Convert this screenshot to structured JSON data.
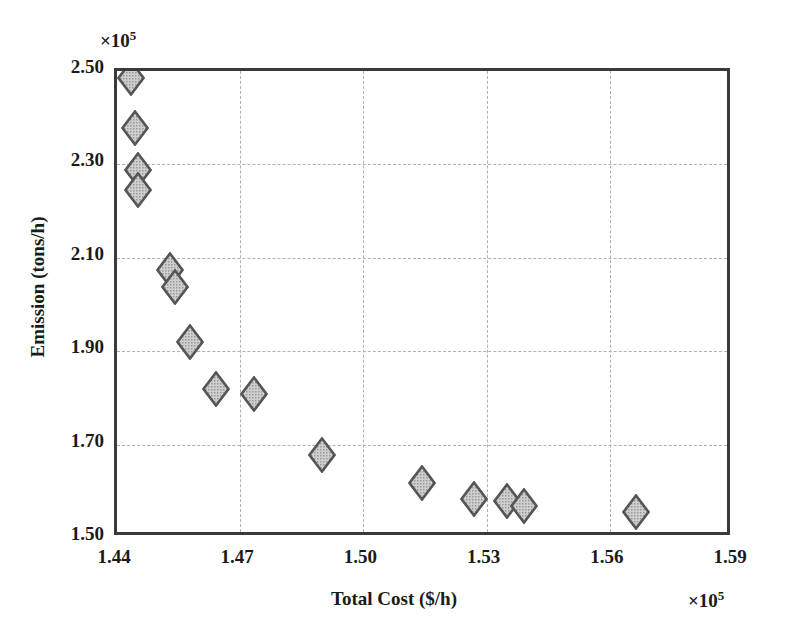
{
  "chart_data": {
    "type": "scatter",
    "title": "",
    "xlabel": "Total Cost ($/h)",
    "ylabel": "Emission (tons/h)",
    "x_exponent_label": "×10",
    "x_exponent_power": "5",
    "y_exponent_label": "×10",
    "y_exponent_power": "5",
    "x_tick_labels": [
      "1.44",
      "1.47",
      "1.50",
      "1.53",
      "1.56",
      "1.59"
    ],
    "y_tick_labels": [
      "1.50",
      "1.70",
      "1.90",
      "2.10",
      "2.30",
      "2.50"
    ],
    "x_ticks": [
      1.44,
      1.47,
      1.5,
      1.53,
      1.56,
      1.59
    ],
    "y_ticks": [
      1.5,
      1.7,
      1.9,
      2.1,
      2.3,
      2.5
    ],
    "xlim": [
      1.44,
      1.59
    ],
    "ylim": [
      1.5,
      2.5
    ],
    "x_scale_factor": 100000,
    "y_scale_factor": 100000,
    "grid": true,
    "legend": null,
    "marker": {
      "shape": "diamond",
      "fill_color": "#b5b5b5",
      "edge_color": "#555555",
      "size_px": 28
    },
    "points": [
      {
        "x": 1.4433,
        "y": 2.485
      },
      {
        "x": 1.4443,
        "y": 2.379
      },
      {
        "x": 1.445,
        "y": 2.289
      },
      {
        "x": 1.4452,
        "y": 2.246
      },
      {
        "x": 1.4529,
        "y": 2.074
      },
      {
        "x": 1.4541,
        "y": 2.038
      },
      {
        "x": 1.4578,
        "y": 1.92
      },
      {
        "x": 1.4641,
        "y": 1.818
      },
      {
        "x": 1.4733,
        "y": 1.809
      },
      {
        "x": 1.4899,
        "y": 1.678
      },
      {
        "x": 1.5143,
        "y": 1.618
      },
      {
        "x": 1.5269,
        "y": 1.583
      },
      {
        "x": 1.5349,
        "y": 1.579
      },
      {
        "x": 1.539,
        "y": 1.568
      },
      {
        "x": 1.5665,
        "y": 1.556
      }
    ]
  }
}
